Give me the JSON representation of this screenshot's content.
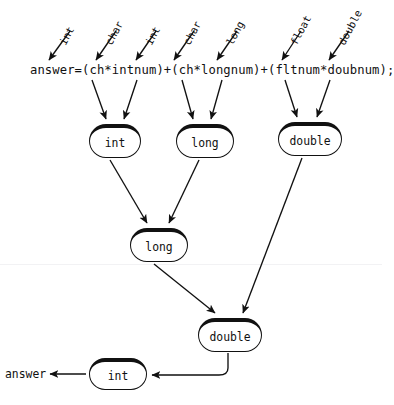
{
  "diagram": {
    "code_expression": "answer=(ch*intnum)+(ch*longnum)+(fltnum*doubnum);",
    "result_label": "answer",
    "ink_color": "#111111",
    "background_color": "#ffffff",
    "operand_types": [
      {
        "label": "int",
        "x": 62,
        "y": 38
      },
      {
        "label": "char",
        "x": 107,
        "y": 38
      },
      {
        "label": "char",
        "x": 185,
        "y": 38
      },
      {
        "label": "long",
        "x": 228,
        "y": 38
      },
      {
        "label": "float",
        "x": 293,
        "y": 38
      },
      {
        "label": "double",
        "x": 340,
        "y": 38
      }
    ],
    "operand_types_extra": [
      {
        "label": "int",
        "x": 147,
        "y": 38
      }
    ],
    "nodes": [
      {
        "id": "n-int-1",
        "label": "int",
        "level": 1,
        "x": 89,
        "y": 124,
        "w": 52,
        "h": 34
      },
      {
        "id": "n-long-1",
        "label": "long",
        "level": 1,
        "x": 176,
        "y": 124,
        "w": 58,
        "h": 34
      },
      {
        "id": "n-double-1",
        "label": "double",
        "level": 1,
        "x": 278,
        "y": 122,
        "w": 64,
        "h": 34
      },
      {
        "id": "n-long-2",
        "label": "long",
        "level": 2,
        "x": 130,
        "y": 228,
        "w": 58,
        "h": 34
      },
      {
        "id": "n-double-2",
        "label": "double",
        "level": 3,
        "x": 198,
        "y": 318,
        "w": 64,
        "h": 34
      },
      {
        "id": "n-int-2",
        "label": "int",
        "level": 4,
        "x": 89,
        "y": 358,
        "w": 58,
        "h": 32
      }
    ],
    "edges": [
      {
        "from": "expr-int",
        "to": "n-int-1"
      },
      {
        "from": "expr-char",
        "to": "n-int-1"
      },
      {
        "from": "expr-char2",
        "to": "n-long-1"
      },
      {
        "from": "expr-long",
        "to": "n-long-1"
      },
      {
        "from": "expr-float",
        "to": "n-double-1"
      },
      {
        "from": "expr-double",
        "to": "n-double-1"
      },
      {
        "from": "n-int-1",
        "to": "n-long-2"
      },
      {
        "from": "n-long-1",
        "to": "n-long-2"
      },
      {
        "from": "n-long-2",
        "to": "n-double-2"
      },
      {
        "from": "n-double-1",
        "to": "n-double-2"
      },
      {
        "from": "n-double-2",
        "to": "n-int-2"
      },
      {
        "from": "n-int-2",
        "to": "result-answer"
      }
    ]
  }
}
